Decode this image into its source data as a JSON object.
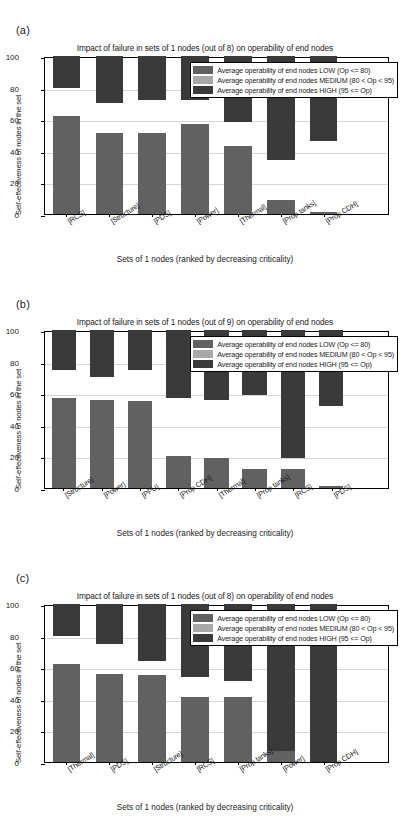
{
  "figure": {
    "panels": [
      {
        "letter": "(a)",
        "title": "Impact of failure in sets of 1 nodes (out of 8) on operability of end nodes",
        "ylabel": "Self-effectiveness of nodes in the set",
        "xlabel": "Sets of 1 nodes (ranked by decreasing criticality)",
        "yticks": [
          "0",
          "20",
          "40",
          "60",
          "80",
          "100"
        ],
        "categories": [
          "[RCS]",
          "[Structure]",
          "[PDS]",
          "[Power]",
          "[Thermal]",
          "[Prop tanks]",
          "[Prop CDH]"
        ],
        "low": [
          62,
          51,
          51,
          57,
          43,
          9,
          1
        ],
        "medium": [
          18,
          19,
          21,
          15,
          15,
          25,
          45
        ],
        "high": [
          20,
          30,
          28,
          28,
          42,
          66,
          54
        ]
      },
      {
        "letter": "(b)",
        "title": "Impact of failure in sets of 1 nodes (out of 9) on operability of end nodes",
        "ylabel": "Self-effectiveness of nodes in the set",
        "xlabel": "Sets of 1 nodes (ranked by decreasing criticality)",
        "yticks": [
          "0",
          "20",
          "40",
          "60",
          "80",
          "100"
        ],
        "categories": [
          "[Structure]",
          "[Power]",
          "[PPU]",
          "[Prop CDH]",
          "[Thermal]",
          "[Prop tanks]",
          "[RCS]",
          "[PDS]"
        ],
        "low": [
          57,
          56,
          55,
          20,
          19,
          12,
          12,
          1
        ],
        "medium": [
          18,
          14,
          20,
          37,
          37,
          47,
          7,
          51
        ],
        "high": [
          25,
          30,
          25,
          43,
          44,
          41,
          81,
          48
        ]
      },
      {
        "letter": "(c)",
        "title": "Impact of failure in sets of 1 nodes (out of 8) on operability of end nodes",
        "ylabel": "Self-effectiveness of nodes in the set",
        "xlabel": "Sets of 1 nodes (ranked by decreasing criticality)",
        "yticks": [
          "0",
          "20",
          "40",
          "60",
          "80",
          "100"
        ],
        "categories": [
          "[Thermal]",
          "[PDS]",
          "[Structure]",
          "[RCS]",
          "[Prop tanks]",
          "[Power]",
          "[Prop CDH]"
        ],
        "low": [
          62,
          56,
          55,
          41,
          41,
          7,
          0
        ],
        "medium": [
          18,
          19,
          9,
          13,
          10,
          0,
          0
        ],
        "high": [
          20,
          25,
          36,
          46,
          49,
          93,
          100
        ]
      }
    ],
    "legend": [
      {
        "key": "low",
        "label": "Average operability of end nodes LOW (Op <= 80)",
        "color": "#616161"
      },
      {
        "key": "medium",
        "label": "Average operability of end nodes MEDIUM (80 < Op < 95)",
        "color": "#a8a8a8"
      },
      {
        "key": "high",
        "label": "Average operability of end nodes HIGH (95 <= Op)",
        "color": "#3a3a3a"
      }
    ]
  },
  "chart_data": [
    {
      "type": "bar",
      "stacked": true,
      "panel": "(a)",
      "title": "Impact of failure in sets of 1 nodes (out of 8) on operability of end nodes",
      "xlabel": "Sets of 1 nodes (ranked by decreasing criticality)",
      "ylabel": "Self-effectiveness of nodes in the set",
      "ylim": [
        0,
        100
      ],
      "yticks": [
        0,
        20,
        40,
        60,
        80,
        100
      ],
      "grid": true,
      "legend_position": "top-right",
      "categories": [
        "[RCS]",
        "[Structure]",
        "[PDS]",
        "[Power]",
        "[Thermal]",
        "[Prop tanks]",
        "[Prop CDH]"
      ],
      "series": [
        {
          "name": "Average operability of end nodes LOW (Op <= 80)",
          "color": "#616161",
          "values": [
            62,
            51,
            51,
            57,
            43,
            9,
            1
          ]
        },
        {
          "name": "Average operability of end nodes MEDIUM (80 < Op < 95)",
          "color": "#a8a8a8",
          "values": [
            18,
            19,
            21,
            15,
            15,
            25,
            45
          ]
        },
        {
          "name": "Average operability of end nodes HIGH (95 <= Op)",
          "color": "#3a3a3a",
          "values": [
            20,
            30,
            28,
            28,
            42,
            66,
            54
          ]
        }
      ]
    },
    {
      "type": "bar",
      "stacked": true,
      "panel": "(b)",
      "title": "Impact of failure in sets of 1 nodes (out of 9) on operability of end nodes",
      "xlabel": "Sets of 1 nodes (ranked by decreasing criticality)",
      "ylabel": "Self-effectiveness of nodes in the set",
      "ylim": [
        0,
        100
      ],
      "yticks": [
        0,
        20,
        40,
        60,
        80,
        100
      ],
      "grid": true,
      "legend_position": "top-right",
      "categories": [
        "[Structure]",
        "[Power]",
        "[PPU]",
        "[Prop CDH]",
        "[Thermal]",
        "[Prop tanks]",
        "[RCS]",
        "[PDS]"
      ],
      "series": [
        {
          "name": "Average operability of end nodes LOW (Op <= 80)",
          "color": "#616161",
          "values": [
            57,
            56,
            55,
            20,
            19,
            12,
            12,
            1
          ]
        },
        {
          "name": "Average operability of end nodes MEDIUM (80 < Op < 95)",
          "color": "#a8a8a8",
          "values": [
            18,
            14,
            20,
            37,
            37,
            47,
            7,
            51
          ]
        },
        {
          "name": "Average operability of end nodes HIGH (95 <= Op)",
          "color": "#3a3a3a",
          "values": [
            25,
            30,
            25,
            43,
            44,
            41,
            81,
            48
          ]
        }
      ]
    },
    {
      "type": "bar",
      "stacked": true,
      "panel": "(c)",
      "title": "Impact of failure in sets of 1 nodes (out of 8) on operability of end nodes",
      "xlabel": "Sets of 1 nodes (ranked by decreasing criticality)",
      "ylabel": "Self-effectiveness of nodes in the set",
      "ylim": [
        0,
        100
      ],
      "yticks": [
        0,
        20,
        40,
        60,
        80,
        100
      ],
      "grid": true,
      "legend_position": "top-right",
      "categories": [
        "[Thermal]",
        "[PDS]",
        "[Structure]",
        "[RCS]",
        "[Prop tanks]",
        "[Power]",
        "[Prop CDH]"
      ],
      "series": [
        {
          "name": "Average operability of end nodes LOW (Op <= 80)",
          "color": "#616161",
          "values": [
            62,
            56,
            55,
            41,
            41,
            7,
            0
          ]
        },
        {
          "name": "Average operability of end nodes MEDIUM (80 < Op < 95)",
          "color": "#a8a8a8",
          "values": [
            18,
            19,
            9,
            13,
            10,
            0,
            0
          ]
        },
        {
          "name": "Average operability of end nodes HIGH (95 <= Op)",
          "color": "#3a3a3a",
          "values": [
            20,
            25,
            36,
            46,
            49,
            93,
            100
          ]
        }
      ]
    }
  ]
}
